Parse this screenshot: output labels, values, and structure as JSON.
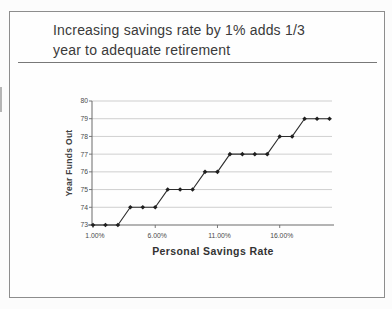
{
  "slide": {
    "title_line1": "Increasing savings rate by 1% adds 1/3",
    "title_line2": "year to adequate retirement"
  },
  "chart_data": {
    "type": "line",
    "title": "",
    "xlabel": "Personal Savings Rate",
    "ylabel": "Year Funds Out",
    "x": [
      1,
      2,
      3,
      4,
      5,
      6,
      7,
      8,
      9,
      10,
      11,
      12,
      13,
      14,
      15,
      16,
      17,
      18,
      19,
      20
    ],
    "x_unit": "percent",
    "values": [
      73,
      73,
      73,
      74,
      74,
      74,
      75,
      75,
      75,
      76,
      76,
      77,
      77,
      77,
      77,
      78,
      78,
      79,
      79,
      79
    ],
    "x_ticks": [
      {
        "value": 1,
        "label": "1.00%"
      },
      {
        "value": 6,
        "label": "6.00%"
      },
      {
        "value": 11,
        "label": "11.00%"
      },
      {
        "value": 16,
        "label": "16.00%"
      }
    ],
    "y_ticks": [
      73,
      74,
      75,
      76,
      77,
      78,
      79,
      80
    ],
    "ylim": [
      73,
      80
    ],
    "grid": "horizontal",
    "legend": "none",
    "marker": "diamond",
    "colors": {
      "line": "#2d2d2d",
      "marker": "#1f1f1f",
      "grid": "#c3c3c3",
      "axis": "#6b6b6b",
      "tick_text": "#4a4a4a"
    }
  }
}
